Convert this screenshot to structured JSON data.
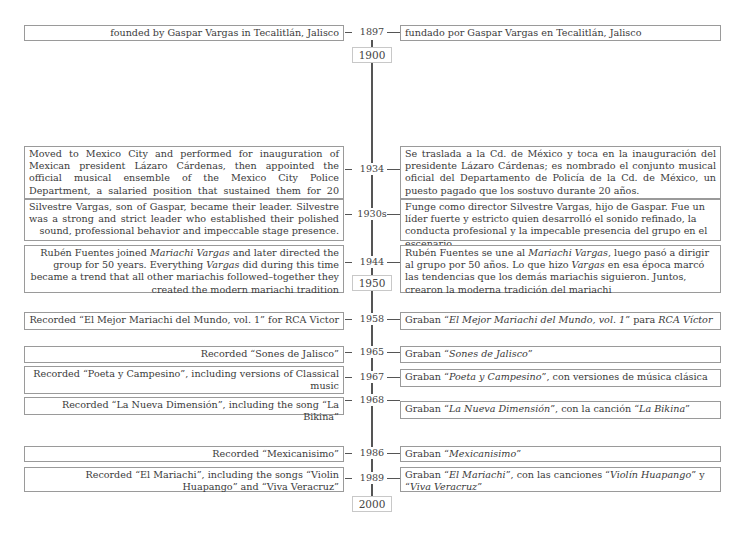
{
  "timeline": {
    "markers": [
      "1900",
      "1950",
      "2000"
    ],
    "events": [
      {
        "year": "1897",
        "en": "founded by Gaspar Vargas in Tecalitlán, Jalisco",
        "es": "fundado por Gaspar Vargas en Tecalitlán, Jalisco"
      },
      {
        "year": "1934",
        "en": "Moved to Mexico City and performed for inauguration of Mexican president Lázaro Cárdenas, then appointed the official musical ensemble of the Mexico City Police Department, a salaried position that sustained them for 20 years.",
        "es": "Se traslada a la Cd. de México y toca en la inauguración del presidente Lázaro Cárdenas; es nombrado el conjunto musical oficial del Departamento de Policía de la Cd. de México, un puesto pagado que los sostuvo durante 20 años."
      },
      {
        "year": "1930s",
        "en": "Silvestre Vargas, son of Gaspar, became their leader. Silvestre was a strong and strict leader who established their polished sound, professional behavior and impeccable stage presence.",
        "es": "Funge como director Silvestre Vargas, hijo de Gaspar. Fue un líder fuerte y estricto quien desarrolló el sonido refinado, la conducta profesional y la impecable presencia del grupo en el escenario."
      },
      {
        "year": "1944",
        "en_parts": [
          "Rubén Fuentes joined ",
          "Mariachi Vargas",
          " and later directed the group for 50 years. Everything ",
          "Vargas",
          " did during this time became a trend that all other mariachis followed–together they created the modern mariachi tradition"
        ],
        "es_parts": [
          "Rubén Fuentes se une al ",
          "Mariachi Vargas",
          ", luego pasó a dirigir al grupo por 50 años. Lo que hizo ",
          "Vargas",
          " en esa época marcó las tendencias que los demás mariachis siguieron. Juntos, crearon la moderna tradición del mariachi"
        ]
      },
      {
        "year": "1958",
        "en": "Recorded “El Mejor Mariachi del Mundo, vol. 1” for RCA Victor",
        "es_parts": [
          "Graban “",
          "El Mejor Mariachi del Mundo, vol. 1",
          "” para ",
          "RCA Víctor"
        ]
      },
      {
        "year": "1965",
        "en": "Recorded “Sones de Jalisco”",
        "es_parts": [
          "Graban “",
          "Sones de Jalisco",
          "”"
        ]
      },
      {
        "year": "1967",
        "en": "Recorded “Poeta y Campesino”, including versions of Classical music",
        "es_parts": [
          "Graban “",
          "Poeta y Campesino",
          "”, con versiones de música clásica"
        ]
      },
      {
        "year": "1968",
        "en": "Recorded “La Nueva Dimensión”, including the song “La Bikina”",
        "es_parts": [
          "Graban “",
          "La Nueva Dimensión",
          "”, con la canción “",
          "La Bikina",
          "”"
        ]
      },
      {
        "year": "1986",
        "en": "Recorded “Mexicanisimo”",
        "es_parts": [
          "Graban “",
          "Mexicanisimo",
          "”"
        ]
      },
      {
        "year": "1989",
        "en": "Recorded “El Mariachi”, including the songs “Violin Huapango” and “Viva Veracruz”",
        "es_parts": [
          "Graban “",
          "El Mariachi",
          "”, con las canciones “",
          "Violín Huapango",
          "” y “",
          "Viva Veracruz",
          "”"
        ]
      }
    ]
  }
}
